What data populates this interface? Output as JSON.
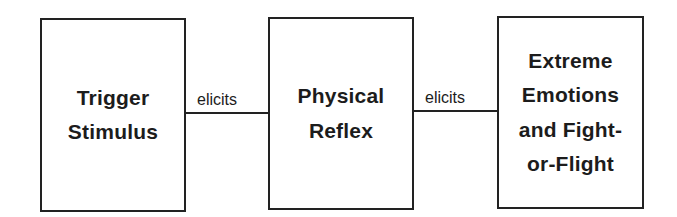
{
  "diagram": {
    "type": "flowchart",
    "direction": "left-to-right",
    "nodes": [
      {
        "id": "trigger",
        "lines": [
          "Trigger",
          "Stimulus"
        ]
      },
      {
        "id": "reflex",
        "lines": [
          "Physical",
          "Reflex"
        ]
      },
      {
        "id": "emotions",
        "lines": [
          "Extreme",
          "Emotions",
          "and Fight-",
          "or-Flight"
        ]
      }
    ],
    "edges": [
      {
        "from": "trigger",
        "to": "reflex",
        "label": "elicits"
      },
      {
        "from": "reflex",
        "to": "emotions",
        "label": "elicits"
      }
    ]
  },
  "colors": {
    "border": "#222222",
    "text": "#1c1c1c",
    "background": "#ffffff"
  }
}
